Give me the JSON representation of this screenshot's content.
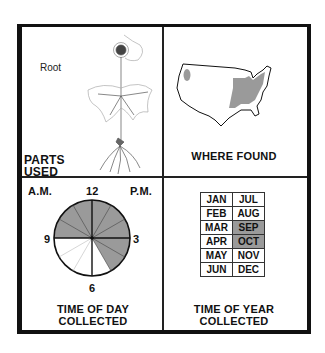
{
  "panels": {
    "parts_used": {
      "title_line1": "PARTS",
      "title_line2": "USED",
      "part_label": "Root"
    },
    "where_found": {
      "title": "WHERE FOUND",
      "map": "USA map with shaded eastern/central range and small northwest patch"
    },
    "time_of_day": {
      "title_line1": "TIME OF DAY",
      "title_line2": "COLLECTED",
      "am_label": "A.M.",
      "pm_label": "P.M.",
      "hour_12": "12",
      "hour_3": "3",
      "hour_6": "6",
      "hour_9": "9",
      "shaded_from_hour": 9,
      "shaded_to_hour": 5
    },
    "time_of_year": {
      "title_line1": "TIME OF YEAR",
      "title_line2": "COLLECTED",
      "months": [
        [
          "JAN",
          "JUL"
        ],
        [
          "FEB",
          "AUG"
        ],
        [
          "MAR",
          "SEP"
        ],
        [
          "APR",
          "OCT"
        ],
        [
          "MAY",
          "NOV"
        ],
        [
          "JUN",
          "DEC"
        ]
      ],
      "shaded_months": [
        "SEP",
        "OCT"
      ]
    }
  },
  "colors": {
    "shade": "#9a9a9a",
    "line": "#111111"
  }
}
